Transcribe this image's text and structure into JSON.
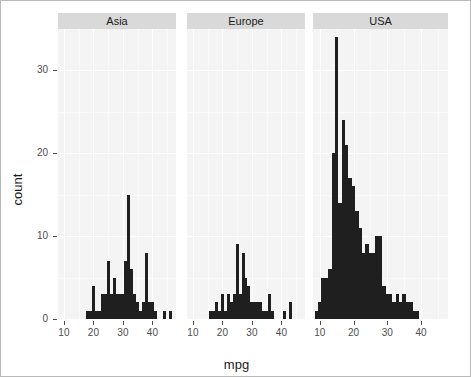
{
  "chart_data": {
    "type": "bar",
    "title": "",
    "subtitle": "",
    "xlabel": "mpg",
    "ylabel": "count",
    "grid": true,
    "legend": "none",
    "facet_variable": "origin",
    "binwidth": 1,
    "xlim": [
      8,
      48
    ],
    "ylim": [
      0,
      35
    ],
    "xticks": [
      10,
      20,
      30,
      40
    ],
    "yticks": [
      0,
      10,
      20,
      30
    ],
    "panels": [
      {
        "label": "Asia",
        "x": [
          18,
          19,
          20,
          21,
          22,
          23,
          24,
          25,
          26,
          27,
          28,
          29,
          30,
          31,
          32,
          33,
          34,
          35,
          36,
          37,
          38,
          39,
          40,
          41,
          44,
          46
        ],
        "values": [
          1,
          1,
          4,
          1,
          1,
          3,
          3,
          7,
          3,
          5,
          3,
          3,
          3,
          7,
          15,
          6,
          3,
          2,
          1,
          2,
          8,
          2,
          2,
          1,
          1,
          1
        ]
      },
      {
        "label": "Europe",
        "x": [
          16,
          17,
          18,
          19,
          20,
          21,
          22,
          23,
          24,
          25,
          26,
          27,
          28,
          29,
          30,
          31,
          32,
          33,
          34,
          35,
          36,
          37,
          41,
          43
        ],
        "values": [
          1,
          1,
          2,
          1,
          3,
          1,
          3,
          2,
          3,
          9,
          3,
          8,
          5,
          4,
          2,
          2,
          2,
          2,
          1,
          1,
          3,
          1,
          1,
          2
        ]
      },
      {
        "label": "USA",
        "x": [
          9,
          10,
          11,
          12,
          13,
          14,
          15,
          16,
          17,
          18,
          19,
          20,
          21,
          22,
          23,
          24,
          25,
          26,
          27,
          28,
          29,
          30,
          31,
          32,
          33,
          34,
          35,
          36,
          37,
          38,
          39
        ],
        "values": [
          1,
          2,
          5,
          5,
          6,
          20,
          34,
          14,
          24,
          21,
          17,
          16,
          13,
          11,
          8,
          9,
          8,
          8,
          10,
          10,
          4,
          3,
          3,
          2,
          3,
          2,
          3,
          2,
          2,
          1,
          1
        ]
      }
    ]
  },
  "axes": {
    "ylabel": "count",
    "xlabel": "mpg",
    "ytick_labels": [
      "30",
      "20",
      "10",
      "0"
    ],
    "xtick_labels": [
      "10",
      "20",
      "30",
      "40"
    ]
  },
  "strips": {
    "asia": "Asia",
    "europe": "Europe",
    "usa": "USA"
  },
  "colors": {
    "bar": "#1f1f1f",
    "panel_background": "#f4f4f4",
    "strip_background": "#d9d9d9",
    "grid": "#ffffff",
    "figure_border": "#b9b9b9",
    "tick_text": "#4d4d4d"
  }
}
